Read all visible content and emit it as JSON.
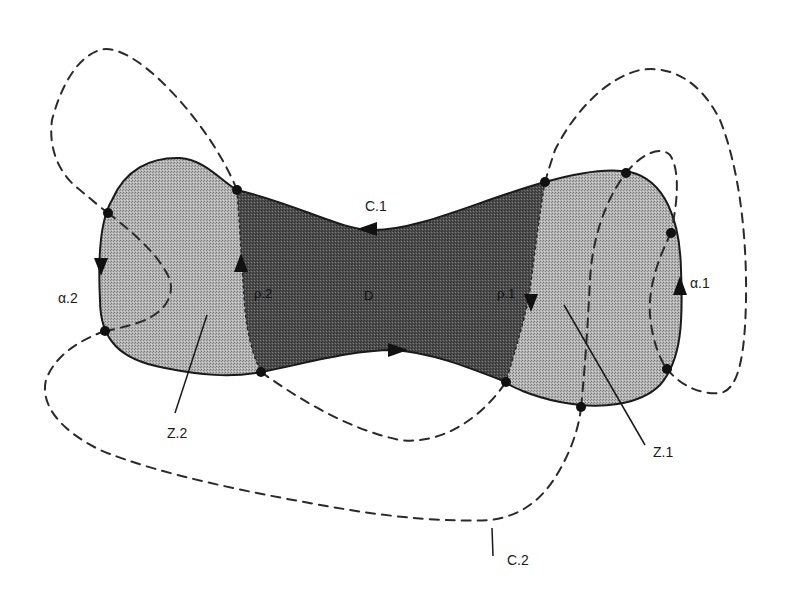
{
  "diagram": {
    "type": "topological-region-diagram",
    "colors": {
      "background": "#ffffff",
      "region_D": "#4a4a4a",
      "region_Z": "#a8a8a8",
      "outline": "#1a1a1a",
      "dashed": "#2a2a2a",
      "dot": "#111111"
    },
    "labels": {
      "C1": "C.1",
      "C2": "C.2",
      "D": "D",
      "rho1": "ρ.1",
      "rho2": "ρ.2",
      "alpha1": "α.1",
      "alpha2": "α.2",
      "Z1": "Z.1",
      "Z2": "Z.2"
    },
    "regions": [
      {
        "id": "Z.2",
        "shade": "light",
        "desc": "left lobe"
      },
      {
        "id": "D",
        "shade": "dark",
        "desc": "central neck region bounded by C.1, ρ.1, ρ.2"
      },
      {
        "id": "Z.1",
        "shade": "light",
        "desc": "right lobe"
      }
    ],
    "curves": [
      {
        "id": "C.1",
        "style": "solid",
        "desc": "outer boundary of the bowtie shape, arrow pointing left on top, right on bottom"
      },
      {
        "id": "C.2",
        "style": "dashed",
        "desc": "large dashed loop weaving around the shape"
      },
      {
        "id": "ρ.1",
        "style": "dotted-boundary",
        "arrow": "down"
      },
      {
        "id": "ρ.2",
        "style": "dotted-boundary",
        "arrow": "up"
      },
      {
        "id": "α.1",
        "style": "solid-segment",
        "arrow": "up"
      },
      {
        "id": "α.2",
        "style": "solid-segment",
        "arrow": "down"
      }
    ],
    "points": [
      {
        "x": 237,
        "y": 190
      },
      {
        "x": 108,
        "y": 213
      },
      {
        "x": 105,
        "y": 331
      },
      {
        "x": 261,
        "y": 372
      },
      {
        "x": 545,
        "y": 182
      },
      {
        "x": 626,
        "y": 173
      },
      {
        "x": 671,
        "y": 233
      },
      {
        "x": 667,
        "y": 369
      },
      {
        "x": 581,
        "y": 407
      },
      {
        "x": 506,
        "y": 382
      }
    ]
  }
}
